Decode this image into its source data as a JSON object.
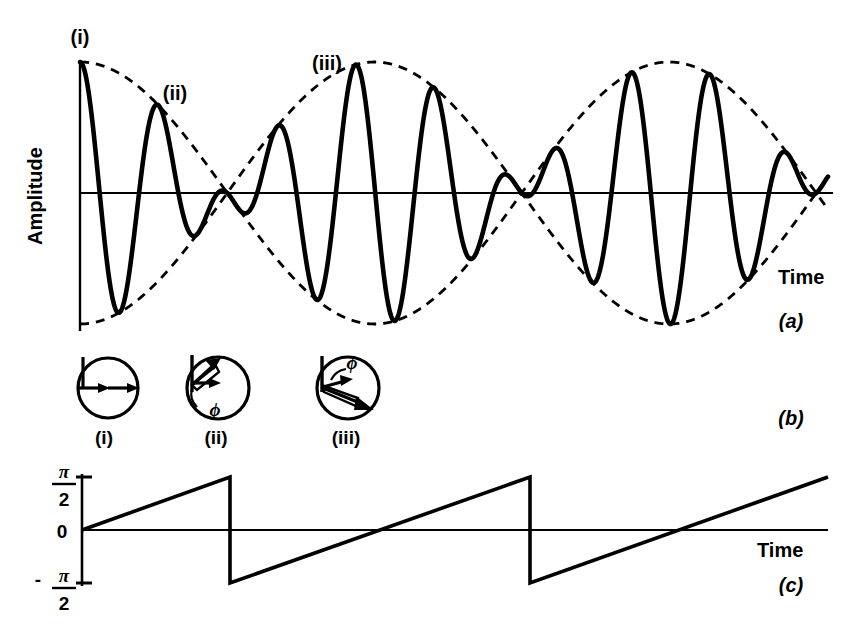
{
  "figure": {
    "background": "#ffffff",
    "ink": "#000000"
  },
  "panel_a": {
    "id": "(a)",
    "ylabel": "Amplitude",
    "xlabel": "Time",
    "markers": [
      {
        "name": "i",
        "label": "(i)",
        "x": 80,
        "y": 36
      },
      {
        "name": "ii",
        "label": "(ii)",
        "x": 170,
        "y": 90
      },
      {
        "name": "iii",
        "label": "(iii)",
        "x": 318,
        "y": 63
      }
    ]
  },
  "panel_b": {
    "id": "(b)",
    "phasors": [
      {
        "name": "i",
        "label": "(i)",
        "phi_label": "",
        "cx": 108,
        "cy": 388,
        "r": 30,
        "vec1_deg": 0,
        "vec1_len": 30,
        "vec2_deg": 0,
        "vec2_len": 30,
        "phi_arc": false
      },
      {
        "name": "ii",
        "label": "(ii)",
        "phi_label": "ϕ",
        "cx": 218,
        "cy": 388,
        "r": 30,
        "vec1_deg": 0,
        "vec1_len": 26,
        "vec2_deg": 62,
        "vec2_len": 30,
        "phi_arc": true
      },
      {
        "name": "iii",
        "label": "(iii)",
        "phi_label": "ϕ",
        "cx": 348,
        "cy": 388,
        "r": 30,
        "vec1_deg": 5,
        "vec1_len": 19,
        "vec2_deg": -30,
        "vec2_len": 32,
        "phi_arc": true
      }
    ]
  },
  "panel_c": {
    "id": "(c)",
    "xlabel": "Time",
    "yticks": [
      {
        "name": "plus-half-pi",
        "num": "π",
        "den": "2",
        "sign": "",
        "value": 1.5708
      },
      {
        "name": "zero",
        "num": "0",
        "den": "",
        "sign": "",
        "value": 0
      },
      {
        "name": "minus-half-pi",
        "num": "π",
        "den": "2",
        "sign": "-",
        "value": -1.5708
      }
    ]
  },
  "chart_data": [
    {
      "name": "modulated-waveform",
      "type": "line",
      "title": "",
      "xlabel": "Time",
      "ylabel": "Amplitude",
      "grid": false,
      "legend": "none",
      "xlim": [
        0,
        1
      ],
      "ylim": [
        -1.05,
        1.05
      ],
      "description": "Carrier of constant frequency multiplied by a slowly varying cosine envelope; envelope reverses sign at each node producing a phase reversal of the carrier.",
      "series": [
        {
          "name": "carrier-times-envelope",
          "style": "solid",
          "linewidth": 4.5,
          "color": "#000000",
          "carrier_cycles": 9.5,
          "carrier_phase_deg": 90,
          "envelope_cycles": 1.27,
          "envelope_phase_deg": 0
        },
        {
          "name": "envelope-upper",
          "style": "dashed",
          "linewidth": 2.6,
          "color": "#000000",
          "envelope_cycles": 1.27,
          "envelope_phase_deg": 0,
          "sign": 1
        },
        {
          "name": "envelope-lower",
          "style": "dashed",
          "linewidth": 2.6,
          "color": "#000000",
          "envelope_cycles": 1.27,
          "envelope_phase_deg": 0,
          "sign": -1
        }
      ],
      "annotations": [
        {
          "text": "(i)",
          "x": 0.0,
          "y": 1.0
        },
        {
          "text": "(ii)",
          "x": 0.12,
          "y": 0.55
        },
        {
          "text": "(iii)",
          "x": 0.32,
          "y": 0.95
        }
      ],
      "axis_lines": {
        "zero_line": true,
        "y_axis": true
      }
    },
    {
      "name": "phase-versus-time",
      "type": "line",
      "title": "",
      "xlabel": "Time",
      "ylabel": "",
      "grid": false,
      "legend": "none",
      "ylim": [
        -1.5708,
        1.5708
      ],
      "ytick_values": [
        1.5708,
        0,
        -1.5708
      ],
      "ytick_labels": [
        "π/2",
        "0",
        "-π/2"
      ],
      "description": "Sawtooth: phase ramps linearly from 0 upward, jumps by -π at each envelope node, period equal to the envelope half-period.",
      "series": [
        {
          "name": "phase-sawtooth",
          "style": "solid",
          "linewidth": 3.5,
          "color": "#000000",
          "points": [
            {
              "x": 82,
              "y": 0
            },
            {
              "x": 230,
              "y": 1.5708
            },
            {
              "x": 230,
              "y": -1.5708
            },
            {
              "x": 530,
              "y": 1.5708
            },
            {
              "x": 530,
              "y": -1.5708
            },
            {
              "x": 828,
              "y": 1.5708
            }
          ]
        }
      ]
    }
  ]
}
